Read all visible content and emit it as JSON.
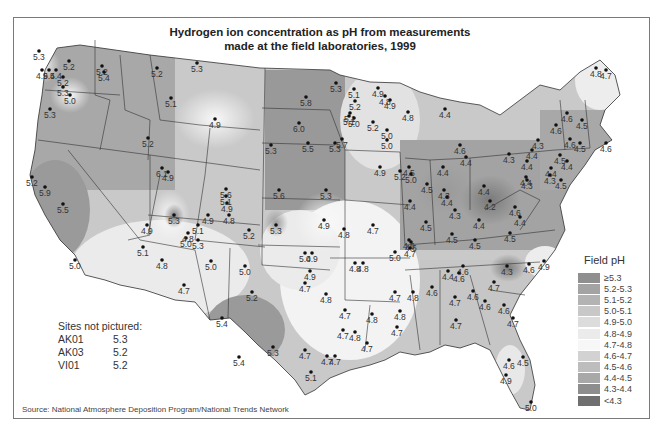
{
  "title": "Hydrogen ion concentration as pH from measurements made at the field laboratories, 1999",
  "title_lines": [
    "Hydrogen ion concentration as pH from measurements",
    "made at the field laboratories, 1999"
  ],
  "source": "Source: National Atmosphere Deposition Program/National Trends Network",
  "legend": {
    "title": "Field pH",
    "items": [
      {
        "label": "≥5.3",
        "color": "#8f8f8f"
      },
      {
        "label": "5.2-5.3",
        "color": "#a3a3a3"
      },
      {
        "label": "5.1-5.2",
        "color": "#b3b3b3"
      },
      {
        "label": "5.0-5.1",
        "color": "#c8c8c8"
      },
      {
        "label": "4.9-5.0",
        "color": "#dcdcdc"
      },
      {
        "label": "4.8-4.9",
        "color": "#ebebeb"
      },
      {
        "label": "4.7-4.8",
        "color": "#f7f7f7"
      },
      {
        "label": "4.6-4.7",
        "color": "#d2d2d2"
      },
      {
        "label": "4.5-4.6",
        "color": "#bdbdbd"
      },
      {
        "label": "4.4-4.5",
        "color": "#a8a8a8"
      },
      {
        "label": "4.3-4.4",
        "color": "#8d8d8d"
      },
      {
        "label": "<4.3",
        "color": "#6f6f6f"
      }
    ]
  },
  "sites_not_pictured": {
    "title": "Sites not pictured:",
    "rows": [
      {
        "id": "AK01",
        "value": "5.3"
      },
      {
        "id": "AK03",
        "value": "5.2"
      },
      {
        "id": "VI01",
        "value": "5.2"
      }
    ]
  },
  "stations": [
    {
      "x": 39,
      "y": 51,
      "v": "5.3"
    },
    {
      "x": 42,
      "y": 70,
      "v": "4.9"
    },
    {
      "x": 69,
      "y": 61,
      "v": "5.2"
    },
    {
      "x": 102,
      "y": 66,
      "v": "5.2"
    },
    {
      "x": 63,
      "y": 77,
      "v": "5.2"
    },
    {
      "x": 56,
      "y": 70,
      "v": "5.4"
    },
    {
      "x": 49,
      "y": 70,
      "v": "5.4"
    },
    {
      "x": 63,
      "y": 87,
      "v": "5.3"
    },
    {
      "x": 104,
      "y": 72,
      "v": "5.4"
    },
    {
      "x": 70,
      "y": 95,
      "v": "5.0"
    },
    {
      "x": 50,
      "y": 109,
      "v": "5.3"
    },
    {
      "x": 148,
      "y": 138,
      "v": "5.2"
    },
    {
      "x": 157,
      "y": 68,
      "v": "5.2"
    },
    {
      "x": 197,
      "y": 63,
      "v": "5.3"
    },
    {
      "x": 171,
      "y": 98,
      "v": "5.1"
    },
    {
      "x": 215,
      "y": 119,
      "v": "4.9"
    },
    {
      "x": 32,
      "y": 177,
      "v": "5.2"
    },
    {
      "x": 45,
      "y": 187,
      "v": "5.9"
    },
    {
      "x": 63,
      "y": 204,
      "v": "5.5"
    },
    {
      "x": 75,
      "y": 260,
      "v": "5.0"
    },
    {
      "x": 162,
      "y": 168,
      "v": "6.1"
    },
    {
      "x": 168,
      "y": 172,
      "v": "4.9"
    },
    {
      "x": 147,
      "y": 225,
      "v": "4.9"
    },
    {
      "x": 143,
      "y": 247,
      "v": "5.1"
    },
    {
      "x": 306,
      "y": 97,
      "v": "5.8"
    },
    {
      "x": 299,
      "y": 123,
      "v": "6.0"
    },
    {
      "x": 271,
      "y": 145,
      "v": "5.3"
    },
    {
      "x": 308,
      "y": 143,
      "v": "5.5"
    },
    {
      "x": 335,
      "y": 143,
      "v": "5.3"
    },
    {
      "x": 174,
      "y": 215,
      "v": "5.3"
    },
    {
      "x": 186,
      "y": 238,
      "v": "5.0"
    },
    {
      "x": 198,
      "y": 225,
      "v": "5.1"
    },
    {
      "x": 208,
      "y": 215,
      "v": "4.9"
    },
    {
      "x": 188,
      "y": 233,
      "v": "4.8"
    },
    {
      "x": 198,
      "y": 240,
      "v": "5.3"
    },
    {
      "x": 226,
      "y": 189,
      "v": "5.6"
    },
    {
      "x": 226,
      "y": 196,
      "v": "5.1"
    },
    {
      "x": 227,
      "y": 203,
      "v": "4.9"
    },
    {
      "x": 229,
      "y": 215,
      "v": "4.8"
    },
    {
      "x": 249,
      "y": 230,
      "v": "5.2"
    },
    {
      "x": 279,
      "y": 190,
      "v": "5.6"
    },
    {
      "x": 326,
      "y": 190,
      "v": "5.3"
    },
    {
      "x": 276,
      "y": 225,
      "v": "5.3"
    },
    {
      "x": 324,
      "y": 220,
      "v": "4.9"
    },
    {
      "x": 211,
      "y": 261,
      "v": "5.0"
    },
    {
      "x": 184,
      "y": 285,
      "v": "4.7"
    },
    {
      "x": 162,
      "y": 260,
      "v": "4.8"
    },
    {
      "x": 245,
      "y": 266,
      "v": "5.0"
    },
    {
      "x": 252,
      "y": 292,
      "v": "5.2"
    },
    {
      "x": 222,
      "y": 318,
      "v": "5.4"
    },
    {
      "x": 239,
      "y": 357,
      "v": "5.4"
    },
    {
      "x": 273,
      "y": 347,
      "v": "5.3"
    },
    {
      "x": 311,
      "y": 372,
      "v": "5.1"
    },
    {
      "x": 327,
      "y": 356,
      "v": "4.7"
    },
    {
      "x": 312,
      "y": 253,
      "v": "4.9"
    },
    {
      "x": 310,
      "y": 271,
      "v": "4.9"
    },
    {
      "x": 305,
      "y": 283,
      "v": "4.7"
    },
    {
      "x": 305,
      "y": 350,
      "v": "4.7"
    },
    {
      "x": 344,
      "y": 229,
      "v": "4.8"
    },
    {
      "x": 373,
      "y": 225,
      "v": "4.7"
    },
    {
      "x": 345,
      "y": 310,
      "v": "4.7"
    },
    {
      "x": 343,
      "y": 330,
      "v": "4.7"
    },
    {
      "x": 335,
      "y": 356,
      "v": "4.7"
    },
    {
      "x": 355,
      "y": 332,
      "v": "4.8"
    },
    {
      "x": 305,
      "y": 253,
      "v": "5.0"
    },
    {
      "x": 355,
      "y": 263,
      "v": "4.8"
    },
    {
      "x": 363,
      "y": 263,
      "v": "4.8"
    },
    {
      "x": 397,
      "y": 327,
      "v": "4.7"
    },
    {
      "x": 367,
      "y": 343,
      "v": "4.7"
    },
    {
      "x": 326,
      "y": 294,
      "v": "4.8"
    },
    {
      "x": 395,
      "y": 292,
      "v": "4.7"
    },
    {
      "x": 413,
      "y": 292,
      "v": "4.8"
    },
    {
      "x": 372,
      "y": 314,
      "v": "4.8"
    },
    {
      "x": 400,
      "y": 311,
      "v": "4.8"
    },
    {
      "x": 395,
      "y": 252,
      "v": "5.0"
    },
    {
      "x": 409,
      "y": 240,
      "v": "4.6"
    },
    {
      "x": 410,
      "y": 248,
      "v": "4.7"
    },
    {
      "x": 336,
      "y": 83,
      "v": "5.3"
    },
    {
      "x": 354,
      "y": 89,
      "v": "5.1"
    },
    {
      "x": 378,
      "y": 88,
      "v": "4.9"
    },
    {
      "x": 385,
      "y": 96,
      "v": "4.8"
    },
    {
      "x": 355,
      "y": 101,
      "v": "5.2"
    },
    {
      "x": 350,
      "y": 113,
      "v": "5.1"
    },
    {
      "x": 373,
      "y": 122,
      "v": "5.2"
    },
    {
      "x": 354,
      "y": 118,
      "v": "5.0"
    },
    {
      "x": 387,
      "y": 130,
      "v": "5.0"
    },
    {
      "x": 349,
      "y": 116,
      "v": "5.1"
    },
    {
      "x": 342,
      "y": 139,
      "v": "5.7"
    },
    {
      "x": 390,
      "y": 100,
      "v": "4.9"
    },
    {
      "x": 408,
      "y": 112,
      "v": "4.8"
    },
    {
      "x": 387,
      "y": 140,
      "v": "5.0"
    },
    {
      "x": 380,
      "y": 167,
      "v": "4.9"
    },
    {
      "x": 409,
      "y": 167,
      "v": "4.5"
    },
    {
      "x": 445,
      "y": 109,
      "v": "4.4"
    },
    {
      "x": 443,
      "y": 167,
      "v": "4.4"
    },
    {
      "x": 411,
      "y": 174,
      "v": "5.0"
    },
    {
      "x": 400,
      "y": 171,
      "v": "5.2"
    },
    {
      "x": 466,
      "y": 157,
      "v": "4.4"
    },
    {
      "x": 460,
      "y": 145,
      "v": "4.6"
    },
    {
      "x": 410,
      "y": 201,
      "v": "4.4"
    },
    {
      "x": 427,
      "y": 184,
      "v": "4.5"
    },
    {
      "x": 444,
      "y": 190,
      "v": "4.3"
    },
    {
      "x": 447,
      "y": 197,
      "v": "4.4"
    },
    {
      "x": 455,
      "y": 210,
      "v": "4.3"
    },
    {
      "x": 426,
      "y": 222,
      "v": "4.5"
    },
    {
      "x": 484,
      "y": 186,
      "v": "4.4"
    },
    {
      "x": 490,
      "y": 201,
      "v": "4.2"
    },
    {
      "x": 479,
      "y": 220,
      "v": "4.4"
    },
    {
      "x": 411,
      "y": 242,
      "v": "4.6"
    },
    {
      "x": 452,
      "y": 234,
      "v": "4.5"
    },
    {
      "x": 475,
      "y": 240,
      "v": "4.5"
    },
    {
      "x": 510,
      "y": 233,
      "v": "4.5"
    },
    {
      "x": 507,
      "y": 266,
      "v": "4.3"
    },
    {
      "x": 529,
      "y": 264,
      "v": "4.6"
    },
    {
      "x": 544,
      "y": 261,
      "v": "4.9"
    },
    {
      "x": 515,
      "y": 207,
      "v": "4.6"
    },
    {
      "x": 520,
      "y": 217,
      "v": "4.4"
    },
    {
      "x": 509,
      "y": 154,
      "v": "4.3"
    },
    {
      "x": 527,
      "y": 180,
      "v": "4.3"
    },
    {
      "x": 527,
      "y": 161,
      "v": "4.4"
    },
    {
      "x": 526,
      "y": 177,
      "v": "4.4"
    },
    {
      "x": 551,
      "y": 168,
      "v": "4.4"
    },
    {
      "x": 550,
      "y": 175,
      "v": "4.3"
    },
    {
      "x": 538,
      "y": 140,
      "v": "4.3"
    },
    {
      "x": 532,
      "y": 150,
      "v": "4.4"
    },
    {
      "x": 567,
      "y": 113,
      "v": "4.6"
    },
    {
      "x": 556,
      "y": 125,
      "v": "4.6"
    },
    {
      "x": 582,
      "y": 120,
      "v": "4.5"
    },
    {
      "x": 570,
      "y": 139,
      "v": "4.6"
    },
    {
      "x": 580,
      "y": 143,
      "v": "4.5"
    },
    {
      "x": 606,
      "y": 143,
      "v": "4.6"
    },
    {
      "x": 560,
      "y": 155,
      "v": "4.5"
    },
    {
      "x": 567,
      "y": 161,
      "v": "4.4"
    },
    {
      "x": 561,
      "y": 180,
      "v": "4.5"
    },
    {
      "x": 596,
      "y": 68,
      "v": "4.8"
    },
    {
      "x": 606,
      "y": 70,
      "v": "4.7"
    },
    {
      "x": 448,
      "y": 271,
      "v": "4.4"
    },
    {
      "x": 463,
      "y": 266,
      "v": "4.6"
    },
    {
      "x": 459,
      "y": 273,
      "v": "4.6"
    },
    {
      "x": 494,
      "y": 282,
      "v": "4.7"
    },
    {
      "x": 473,
      "y": 291,
      "v": "4.6"
    },
    {
      "x": 455,
      "y": 297,
      "v": "4.7"
    },
    {
      "x": 432,
      "y": 287,
      "v": "4.6"
    },
    {
      "x": 456,
      "y": 320,
      "v": "4.7"
    },
    {
      "x": 485,
      "y": 301,
      "v": "4.6"
    },
    {
      "x": 504,
      "y": 305,
      "v": "4.6"
    },
    {
      "x": 513,
      "y": 318,
      "v": "4.7"
    },
    {
      "x": 509,
      "y": 360,
      "v": "4.6"
    },
    {
      "x": 523,
      "y": 357,
      "v": "4.5"
    },
    {
      "x": 506,
      "y": 375,
      "v": "4.9"
    },
    {
      "x": 531,
      "y": 402,
      "v": "5.0"
    }
  ]
}
